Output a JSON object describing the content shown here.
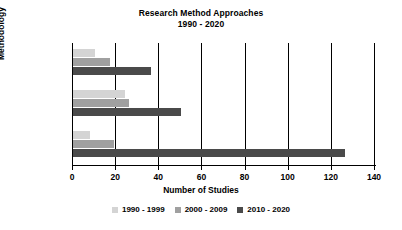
{
  "chart_data": {
    "type": "bar",
    "orientation": "horizontal",
    "title": "Research Method Approaches",
    "subtitle": "1990 - 2020",
    "xlabel": "Number of Studies",
    "ylabel": "Methodology",
    "categories": [
      "MM",
      "Qual",
      "Quant"
    ],
    "series": [
      {
        "name": "1990 - 1999",
        "color": "#d4d4d4",
        "values": [
          10,
          24,
          8
        ]
      },
      {
        "name": "2000 - 2009",
        "color": "#a0a0a0",
        "values": [
          17,
          26,
          19
        ]
      },
      {
        "name": "2010 - 2020",
        "color": "#4a4a4a",
        "values": [
          36,
          50,
          126
        ]
      }
    ],
    "xlim": [
      0,
      140
    ],
    "xticks": [
      0,
      20,
      40,
      60,
      80,
      100,
      120,
      140
    ],
    "grid": "vertical",
    "legend_position": "bottom"
  }
}
